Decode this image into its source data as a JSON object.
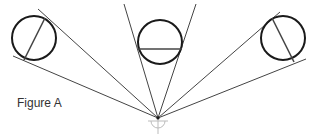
{
  "figure": {
    "label": "Figure A",
    "colors": {
      "stroke": "#1a1a1a",
      "line": "#444444",
      "faint": "#bbbbbb",
      "text": "#333333"
    },
    "vertex": {
      "x": 158,
      "y": 118
    },
    "circles": [
      {
        "name": "left",
        "cx": 34,
        "cy": 38,
        "r": 22,
        "chord": [
          45,
          18,
          24,
          60
        ],
        "tangents": [
          [
            38,
            9
          ],
          [
            13,
            56
          ]
        ]
      },
      {
        "name": "middle",
        "cx": 160,
        "cy": 42,
        "r": 22,
        "chord": [
          138,
          49,
          182,
          49
        ],
        "tangents": [
          [
            124,
            4
          ],
          [
            196,
            4
          ]
        ]
      },
      {
        "name": "right",
        "cx": 283,
        "cy": 38,
        "r": 22,
        "chord": [
          272,
          18,
          294,
          62
        ],
        "tangents": [
          [
            280,
            12
          ],
          [
            306,
            59
          ]
        ]
      }
    ]
  }
}
